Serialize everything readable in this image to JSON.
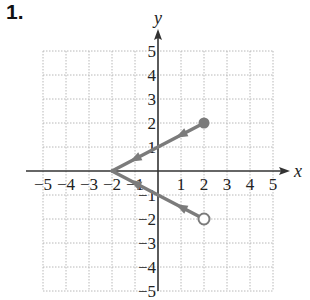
{
  "problem": {
    "number": "1."
  },
  "chart_data": {
    "type": "line",
    "title": "",
    "xlabel": "x",
    "ylabel": "y",
    "xlim": [
      -5,
      5
    ],
    "ylim": [
      -5,
      5
    ],
    "grid": true,
    "x_ticks": [
      "−5",
      "−4",
      "−3",
      "−2",
      "−1",
      "1",
      "2",
      "3",
      "4",
      "5"
    ],
    "y_ticks": [
      "5",
      "4",
      "3",
      "2",
      "1",
      "−1",
      "−2",
      "−3",
      "−4",
      "−5"
    ],
    "series": [
      {
        "name": "upper branch",
        "points": [
          [
            -2,
            0
          ],
          [
            2,
            2
          ]
        ],
        "end_marker": "filled-circle",
        "end_point": [
          2,
          2
        ]
      },
      {
        "name": "lower branch",
        "points": [
          [
            -2,
            0
          ],
          [
            2,
            -2
          ]
        ],
        "end_marker": "open-circle",
        "end_point": [
          2,
          -2
        ]
      }
    ],
    "line_color": "#7b7b7b",
    "grid_color": "#b8b8b8"
  }
}
